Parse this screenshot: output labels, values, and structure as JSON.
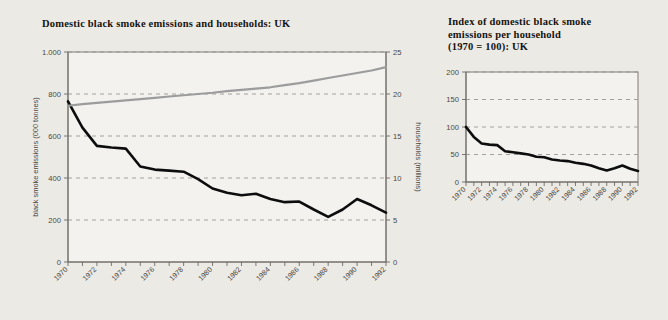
{
  "background_color": "#eceae5",
  "left_panel": {
    "title": "Domestic black smoke emissions and households: UK"
  },
  "right_panel": {
    "title": "Index of domestic black smoke\nemissions per household\n(1970 = 100): UK"
  },
  "chart_data": [
    {
      "type": "line",
      "title": "Domestic black smoke emissions and households: UK",
      "xlabel": "",
      "ylabel": "black smoke emissions (000 tonnes)",
      "y2label": "households (millions)",
      "grid": true,
      "legend": "none",
      "xlim": [
        1970,
        1992
      ],
      "ylim": [
        0,
        1000
      ],
      "y2lim": [
        0,
        25
      ],
      "yticks": [
        0,
        200,
        400,
        600,
        800,
        1000
      ],
      "ytick_labels": [
        "0",
        "200",
        "400",
        "600",
        "800",
        "1.000"
      ],
      "y2ticks": [
        0,
        5,
        10,
        15,
        20,
        25
      ],
      "y2tick_labels": [
        "0",
        "5",
        "10",
        "15",
        "20",
        "25"
      ],
      "x": [
        1970,
        1971,
        1972,
        1973,
        1974,
        1975,
        1976,
        1977,
        1978,
        1979,
        1980,
        1981,
        1982,
        1983,
        1984,
        1985,
        1986,
        1987,
        1988,
        1989,
        1990,
        1991,
        1992
      ],
      "xtick_labels": [
        "1970",
        "",
        "1972",
        "",
        "1974",
        "",
        "1976",
        "",
        "1978",
        "",
        "1980",
        "",
        "1982",
        "",
        "1984",
        "",
        "1986",
        "",
        "1988",
        "",
        "1990",
        "",
        "1992"
      ],
      "series": [
        {
          "name": "black smoke emissions (000 tonnes)",
          "axis": "left",
          "color": "#0d0d0d",
          "values": [
            765,
            640,
            553,
            545,
            540,
            455,
            440,
            435,
            430,
            395,
            350,
            330,
            318,
            325,
            300,
            285,
            288,
            250,
            215,
            250,
            300,
            270,
            235
          ]
        },
        {
          "name": "households (millions)",
          "axis": "right",
          "color": "#9c9c9c",
          "values": [
            18.6,
            18.8,
            18.95,
            19.1,
            19.25,
            19.4,
            19.55,
            19.7,
            19.85,
            20.0,
            20.15,
            20.35,
            20.5,
            20.65,
            20.8,
            21.05,
            21.3,
            21.6,
            21.9,
            22.2,
            22.5,
            22.8,
            23.2
          ]
        }
      ]
    },
    {
      "type": "line",
      "title": "Index of domestic black smoke emissions per household (1970 = 100): UK",
      "xlabel": "",
      "ylabel": "",
      "grid": true,
      "legend": "none",
      "xlim": [
        1970,
        1992
      ],
      "ylim": [
        0,
        200
      ],
      "yticks": [
        0,
        50,
        100,
        150,
        200
      ],
      "ytick_labels": [
        "0",
        "50",
        "100",
        "150",
        "200"
      ],
      "x": [
        1970,
        1971,
        1972,
        1973,
        1974,
        1975,
        1976,
        1977,
        1978,
        1979,
        1980,
        1981,
        1982,
        1983,
        1984,
        1985,
        1986,
        1987,
        1988,
        1989,
        1990,
        1991,
        1992
      ],
      "xtick_labels": [
        "1970",
        "",
        "1972",
        "",
        "1974",
        "",
        "1976",
        "",
        "1978",
        "",
        "1980",
        "",
        "1982",
        "",
        "1984",
        "",
        "1986",
        "",
        "1988",
        "",
        "1990",
        "",
        "1992"
      ],
      "series": [
        {
          "name": "index (1970 = 100)",
          "axis": "left",
          "color": "#0d0d0d",
          "values": [
            100,
            82,
            70,
            68,
            67,
            56,
            54,
            52,
            50,
            46,
            45,
            41,
            39,
            38,
            35,
            33,
            30,
            25,
            21,
            25,
            30,
            24,
            20
          ]
        }
      ]
    }
  ]
}
